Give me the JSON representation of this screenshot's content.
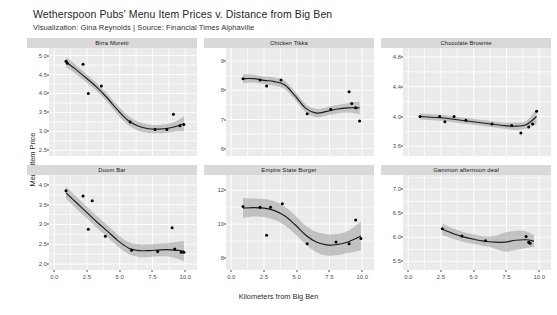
{
  "header": {
    "title": "Wetherspoon Pubs' Menu Item Prices v. Distance from Big Ben",
    "subtitle": "Visualization: Gina Reynolds | Source: Financial Times Alphaville"
  },
  "axes": {
    "y_title": "Menu Item Price",
    "x_title": "Kilometers from Big Ben"
  },
  "style": {
    "panel_bg": "#ebebeb",
    "grid_color": "#ffffff",
    "strip_bg": "#d9d9d9",
    "point_color": "#000000",
    "line_color": "#1a1a1a",
    "ribbon_color": "#9f9f9f",
    "page_bg": "#ffffff"
  },
  "chart_data": {
    "type": "scatter",
    "title": "Wetherspoon Pubs' Menu Item Prices v. Distance from Big Ben",
    "subtitle": "Visualization: Gina Reynolds | Source: Financial Times Alphaville",
    "xlabel": "Kilometers from Big Ben",
    "ylabel": "Menu Item Price",
    "grid": true,
    "legend": "none",
    "facet_layout": [
      3,
      2
    ],
    "xlim": [
      -0.4,
      10.9
    ],
    "x_ticks": [
      "0.0",
      "2.5",
      "5.0",
      "7.5",
      "10.0"
    ],
    "x_tick_values": [
      0.0,
      2.5,
      5.0,
      7.5,
      10.0
    ],
    "panels": [
      {
        "title": "Birra Moretti",
        "ylim": [
          2.35,
          5.2
        ],
        "y_ticks": [
          "2.5",
          "3.0",
          "3.5",
          "4.0",
          "4.5",
          "5.0"
        ],
        "y_tick_values": [
          2.5,
          3.0,
          3.5,
          4.0,
          4.5,
          5.0
        ],
        "points": [
          {
            "x": 0.9,
            "y": 4.85
          },
          {
            "x": 1.0,
            "y": 4.8
          },
          {
            "x": 2.2,
            "y": 4.77
          },
          {
            "x": 2.6,
            "y": 4.0
          },
          {
            "x": 3.6,
            "y": 4.2
          },
          {
            "x": 5.8,
            "y": 3.25
          },
          {
            "x": 7.7,
            "y": 3.05
          },
          {
            "x": 8.6,
            "y": 3.05
          },
          {
            "x": 9.1,
            "y": 3.45
          },
          {
            "x": 9.6,
            "y": 3.15
          },
          {
            "x": 9.9,
            "y": 3.18
          }
        ],
        "smooth": [
          {
            "x": 0.9,
            "y": 4.83,
            "lo": 4.7,
            "hi": 4.96
          },
          {
            "x": 1.6,
            "y": 4.65,
            "lo": 4.53,
            "hi": 4.77
          },
          {
            "x": 2.4,
            "y": 4.42,
            "lo": 4.31,
            "hi": 4.53
          },
          {
            "x": 3.2,
            "y": 4.18,
            "lo": 4.07,
            "hi": 4.29
          },
          {
            "x": 4.0,
            "y": 3.9,
            "lo": 3.79,
            "hi": 4.01
          },
          {
            "x": 4.8,
            "y": 3.58,
            "lo": 3.46,
            "hi": 3.7
          },
          {
            "x": 5.6,
            "y": 3.3,
            "lo": 3.18,
            "hi": 3.42
          },
          {
            "x": 6.4,
            "y": 3.14,
            "lo": 3.02,
            "hi": 3.26
          },
          {
            "x": 7.2,
            "y": 3.07,
            "lo": 2.96,
            "hi": 3.18
          },
          {
            "x": 8.0,
            "y": 3.06,
            "lo": 2.95,
            "hi": 3.17
          },
          {
            "x": 8.8,
            "y": 3.09,
            "lo": 2.97,
            "hi": 3.21
          },
          {
            "x": 9.4,
            "y": 3.14,
            "lo": 3.0,
            "hi": 3.28
          },
          {
            "x": 9.9,
            "y": 3.2,
            "lo": 3.0,
            "hi": 3.4
          }
        ]
      },
      {
        "title": "Chicken Tikka",
        "ylim": [
          5.75,
          9.45
        ],
        "y_ticks": [
          "6",
          "7",
          "8",
          "9"
        ],
        "y_tick_values": [
          6,
          7,
          8,
          9
        ],
        "points": [
          {
            "x": 0.9,
            "y": 8.4
          },
          {
            "x": 2.2,
            "y": 8.35
          },
          {
            "x": 2.7,
            "y": 8.15
          },
          {
            "x": 3.8,
            "y": 8.35
          },
          {
            "x": 5.8,
            "y": 7.2
          },
          {
            "x": 7.6,
            "y": 7.35
          },
          {
            "x": 9.0,
            "y": 7.95
          },
          {
            "x": 9.2,
            "y": 7.55
          },
          {
            "x": 9.5,
            "y": 7.4
          },
          {
            "x": 9.8,
            "y": 6.95
          }
        ],
        "smooth": [
          {
            "x": 0.9,
            "y": 8.4,
            "lo": 8.25,
            "hi": 8.55
          },
          {
            "x": 1.7,
            "y": 8.4,
            "lo": 8.27,
            "hi": 8.53
          },
          {
            "x": 2.5,
            "y": 8.34,
            "lo": 8.21,
            "hi": 8.47
          },
          {
            "x": 3.3,
            "y": 8.3,
            "lo": 8.16,
            "hi": 8.44
          },
          {
            "x": 4.1,
            "y": 8.18,
            "lo": 8.04,
            "hi": 8.32
          },
          {
            "x": 4.9,
            "y": 7.8,
            "lo": 7.66,
            "hi": 7.94
          },
          {
            "x": 5.7,
            "y": 7.38,
            "lo": 7.24,
            "hi": 7.52
          },
          {
            "x": 6.5,
            "y": 7.22,
            "lo": 7.08,
            "hi": 7.36
          },
          {
            "x": 7.3,
            "y": 7.28,
            "lo": 7.14,
            "hi": 7.42
          },
          {
            "x": 8.1,
            "y": 7.36,
            "lo": 7.21,
            "hi": 7.51
          },
          {
            "x": 8.9,
            "y": 7.4,
            "lo": 7.24,
            "hi": 7.56
          },
          {
            "x": 9.8,
            "y": 7.4,
            "lo": 7.18,
            "hi": 7.62
          }
        ]
      },
      {
        "title": "Chocolate Brownie",
        "ylim": [
          3.47,
          4.92
        ],
        "y_ticks": [
          "3.6",
          "4.0",
          "4.4",
          "4.8"
        ],
        "y_tick_values": [
          3.6,
          4.0,
          4.4,
          4.8
        ],
        "points": [
          {
            "x": 0.9,
            "y": 4.0
          },
          {
            "x": 2.4,
            "y": 4.0
          },
          {
            "x": 2.8,
            "y": 3.93
          },
          {
            "x": 3.5,
            "y": 4.0
          },
          {
            "x": 4.4,
            "y": 3.95
          },
          {
            "x": 6.4,
            "y": 3.9
          },
          {
            "x": 7.9,
            "y": 3.88
          },
          {
            "x": 8.6,
            "y": 3.78
          },
          {
            "x": 9.2,
            "y": 3.86
          },
          {
            "x": 9.5,
            "y": 3.9
          },
          {
            "x": 9.8,
            "y": 4.07
          }
        ],
        "smooth": [
          {
            "x": 0.9,
            "y": 4.0,
            "lo": 3.96,
            "hi": 4.04
          },
          {
            "x": 1.8,
            "y": 3.99,
            "lo": 3.95,
            "hi": 4.03
          },
          {
            "x": 2.7,
            "y": 3.98,
            "lo": 3.94,
            "hi": 4.02
          },
          {
            "x": 3.6,
            "y": 3.96,
            "lo": 3.92,
            "hi": 4.0
          },
          {
            "x": 4.5,
            "y": 3.94,
            "lo": 3.9,
            "hi": 3.98
          },
          {
            "x": 5.4,
            "y": 3.92,
            "lo": 3.88,
            "hi": 3.96
          },
          {
            "x": 6.3,
            "y": 3.9,
            "lo": 3.86,
            "hi": 3.94
          },
          {
            "x": 7.2,
            "y": 3.88,
            "lo": 3.84,
            "hi": 3.92
          },
          {
            "x": 8.1,
            "y": 3.87,
            "lo": 3.82,
            "hi": 3.92
          },
          {
            "x": 9.0,
            "y": 3.89,
            "lo": 3.84,
            "hi": 3.94
          },
          {
            "x": 9.8,
            "y": 4.0,
            "lo": 3.9,
            "hi": 4.1
          }
        ]
      },
      {
        "title": "Doom Bar",
        "ylim": [
          1.85,
          4.25
        ],
        "y_ticks": [
          "2.0",
          "2.5",
          "3.0",
          "3.5",
          "4.0"
        ],
        "y_tick_values": [
          2.0,
          2.5,
          3.0,
          3.5,
          4.0
        ],
        "points": [
          {
            "x": 0.9,
            "y": 3.85
          },
          {
            "x": 2.2,
            "y": 3.72
          },
          {
            "x": 2.9,
            "y": 3.6
          },
          {
            "x": 2.6,
            "y": 2.88
          },
          {
            "x": 3.9,
            "y": 2.7
          },
          {
            "x": 5.9,
            "y": 2.35
          },
          {
            "x": 7.9,
            "y": 2.32
          },
          {
            "x": 9.0,
            "y": 2.92
          },
          {
            "x": 9.2,
            "y": 2.38
          },
          {
            "x": 9.7,
            "y": 2.3
          },
          {
            "x": 9.9,
            "y": 2.3
          }
        ],
        "smooth": [
          {
            "x": 0.9,
            "y": 3.8,
            "lo": 3.65,
            "hi": 3.95
          },
          {
            "x": 1.7,
            "y": 3.55,
            "lo": 3.4,
            "hi": 3.7
          },
          {
            "x": 2.5,
            "y": 3.3,
            "lo": 3.15,
            "hi": 3.45
          },
          {
            "x": 3.3,
            "y": 3.05,
            "lo": 2.9,
            "hi": 3.2
          },
          {
            "x": 4.1,
            "y": 2.82,
            "lo": 2.67,
            "hi": 2.97
          },
          {
            "x": 4.9,
            "y": 2.58,
            "lo": 2.43,
            "hi": 2.73
          },
          {
            "x": 5.7,
            "y": 2.4,
            "lo": 2.25,
            "hi": 2.55
          },
          {
            "x": 6.5,
            "y": 2.34,
            "lo": 2.18,
            "hi": 2.5
          },
          {
            "x": 7.3,
            "y": 2.34,
            "lo": 2.18,
            "hi": 2.5
          },
          {
            "x": 8.1,
            "y": 2.36,
            "lo": 2.2,
            "hi": 2.52
          },
          {
            "x": 8.9,
            "y": 2.36,
            "lo": 2.18,
            "hi": 2.54
          },
          {
            "x": 9.9,
            "y": 2.33,
            "lo": 2.08,
            "hi": 2.58
          }
        ]
      },
      {
        "title": "Empire State Burger",
        "ylim": [
          7.3,
          12.9
        ],
        "y_ticks": [
          "8",
          "10",
          "12"
        ],
        "y_tick_values": [
          8,
          10,
          12
        ],
        "points": [
          {
            "x": 0.9,
            "y": 11.05
          },
          {
            "x": 2.2,
            "y": 11.0
          },
          {
            "x": 3.0,
            "y": 11.0
          },
          {
            "x": 2.7,
            "y": 9.35
          },
          {
            "x": 3.9,
            "y": 11.2
          },
          {
            "x": 5.8,
            "y": 8.85
          },
          {
            "x": 8.0,
            "y": 8.95
          },
          {
            "x": 9.0,
            "y": 8.85
          },
          {
            "x": 9.5,
            "y": 10.25
          },
          {
            "x": 9.9,
            "y": 9.15
          }
        ],
        "smooth": [
          {
            "x": 0.9,
            "y": 10.95,
            "lo": 10.35,
            "hi": 11.55
          },
          {
            "x": 1.7,
            "y": 10.98,
            "lo": 10.45,
            "hi": 11.51
          },
          {
            "x": 2.5,
            "y": 10.95,
            "lo": 10.42,
            "hi": 11.48
          },
          {
            "x": 3.3,
            "y": 10.8,
            "lo": 10.25,
            "hi": 11.35
          },
          {
            "x": 4.1,
            "y": 10.48,
            "lo": 9.93,
            "hi": 11.03
          },
          {
            "x": 4.9,
            "y": 9.95,
            "lo": 9.4,
            "hi": 10.5
          },
          {
            "x": 5.7,
            "y": 9.35,
            "lo": 8.8,
            "hi": 9.9
          },
          {
            "x": 6.5,
            "y": 8.95,
            "lo": 8.35,
            "hi": 9.55
          },
          {
            "x": 7.3,
            "y": 8.78,
            "lo": 8.15,
            "hi": 9.41
          },
          {
            "x": 8.1,
            "y": 8.8,
            "lo": 8.18,
            "hi": 9.42
          },
          {
            "x": 8.9,
            "y": 8.95,
            "lo": 8.3,
            "hi": 9.6
          },
          {
            "x": 9.9,
            "y": 9.3,
            "lo": 8.45,
            "hi": 10.15
          }
        ]
      },
      {
        "title": "Gammon afternoon deal",
        "ylim": [
          5.32,
          7.3
        ],
        "y_ticks": [
          "5.5",
          "6.0",
          "6.5",
          "7.0"
        ],
        "y_tick_values": [
          5.5,
          6.0,
          6.5,
          7.0
        ],
        "points": [
          {
            "x": 2.6,
            "y": 6.18
          },
          {
            "x": 4.1,
            "y": 6.03
          },
          {
            "x": 5.9,
            "y": 5.93
          },
          {
            "x": 9.0,
            "y": 6.02
          },
          {
            "x": 9.2,
            "y": 5.9
          },
          {
            "x": 9.3,
            "y": 5.88
          }
        ],
        "smooth": [
          {
            "x": 2.6,
            "y": 6.17,
            "lo": 6.05,
            "hi": 6.29
          },
          {
            "x": 3.4,
            "y": 6.08,
            "lo": 5.97,
            "hi": 6.19
          },
          {
            "x": 4.2,
            "y": 6.01,
            "lo": 5.91,
            "hi": 6.11
          },
          {
            "x": 5.0,
            "y": 5.96,
            "lo": 5.86,
            "hi": 6.06
          },
          {
            "x": 5.8,
            "y": 5.92,
            "lo": 5.82,
            "hi": 6.02
          },
          {
            "x": 6.6,
            "y": 5.9,
            "lo": 5.77,
            "hi": 6.03
          },
          {
            "x": 7.4,
            "y": 5.9,
            "lo": 5.7,
            "hi": 6.1
          },
          {
            "x": 8.2,
            "y": 5.94,
            "lo": 5.74,
            "hi": 6.14
          },
          {
            "x": 9.0,
            "y": 5.95,
            "lo": 5.78,
            "hi": 6.12
          },
          {
            "x": 9.6,
            "y": 5.92,
            "lo": 5.8,
            "hi": 6.04
          }
        ]
      }
    ]
  }
}
